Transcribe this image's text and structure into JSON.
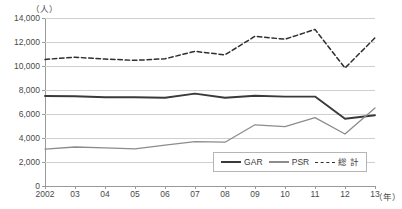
{
  "chart_data": {
    "type": "line",
    "title": "",
    "xlabel": "（年）",
    "ylabel": "（人）",
    "ylim": [
      0,
      14000
    ],
    "ytick_values": [
      0,
      2000,
      4000,
      6000,
      8000,
      10000,
      12000,
      14000
    ],
    "ytick_labels": [
      "0",
      "2,000",
      "4,000",
      "6,000",
      "8,000",
      "10,000",
      "12,000",
      "14,000"
    ],
    "categories": [
      "2002",
      "03",
      "04",
      "05",
      "06",
      "07",
      "08",
      "09",
      "10",
      "11",
      "12",
      "13"
    ],
    "grid": true,
    "legend_position": "inside-bottom-right",
    "series": [
      {
        "name": "GAR",
        "style": "solid",
        "color": "#3a3a3a",
        "values": [
          7500,
          7480,
          7400,
          7400,
          7350,
          7700,
          7350,
          7520,
          7450,
          7450,
          5600,
          5900
        ]
      },
      {
        "name": "PSR",
        "style": "solid",
        "color": "#8c8c8c",
        "values": [
          3080,
          3250,
          3180,
          3100,
          3400,
          3700,
          3650,
          5100,
          4950,
          5700,
          4330,
          6500
        ]
      },
      {
        "name": "総計",
        "style": "dashed",
        "color": "#2e2e2e",
        "values": [
          10550,
          10730,
          10580,
          10470,
          10600,
          11220,
          10930,
          12480,
          12230,
          13050,
          9830,
          12350
        ]
      }
    ]
  },
  "legend": {
    "entries": [
      {
        "label": "GAR"
      },
      {
        "label": "PSR"
      },
      {
        "label": "総 計"
      }
    ]
  },
  "axes": {
    "y_unit": "（人）",
    "x_unit": "（年）"
  }
}
